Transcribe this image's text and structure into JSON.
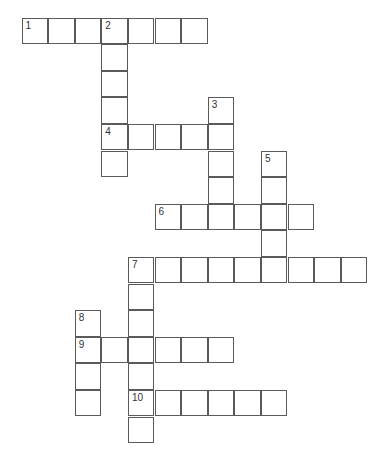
{
  "puzzle": {
    "cell_size": 26.6,
    "origin": [
      22,
      18
    ],
    "border_color": "#5a5a5a",
    "entries": [
      {
        "number": "1",
        "direction": "across",
        "row": 0,
        "col": 0,
        "length": 7
      },
      {
        "number": "2",
        "direction": "down",
        "row": 0,
        "col": 3,
        "length": 6
      },
      {
        "number": "3",
        "direction": "down",
        "row": 3,
        "col": 7,
        "length": 5
      },
      {
        "number": "4",
        "direction": "across",
        "row": 4,
        "col": 3,
        "length": 5
      },
      {
        "number": "5",
        "direction": "down",
        "row": 5,
        "col": 9,
        "length": 4
      },
      {
        "number": "6",
        "direction": "across",
        "row": 7,
        "col": 5,
        "length": 6
      },
      {
        "number": "7",
        "direction": "across",
        "row": 9,
        "col": 4,
        "length": 9
      },
      {
        "number": "7",
        "direction": "down",
        "row": 9,
        "col": 4,
        "length": 7
      },
      {
        "number": "8",
        "direction": "down",
        "row": 11,
        "col": 2,
        "length": 4
      },
      {
        "number": "9",
        "direction": "across",
        "row": 12,
        "col": 2,
        "length": 6
      },
      {
        "number": "10",
        "direction": "across",
        "row": 14,
        "col": 4,
        "length": 6
      }
    ]
  }
}
